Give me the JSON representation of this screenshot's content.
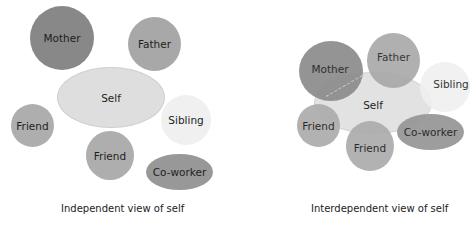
{
  "colors": {
    "mother": "#888888",
    "father": "#a8a8a8",
    "self": "#dedede",
    "sibling": "#f0f0f0",
    "friend": "#aeaeae",
    "coworker": "#989898",
    "background": "#ffffff",
    "text": "#1e1e1e"
  },
  "independent": {
    "caption": "Independent view of self",
    "nodes": {
      "mother": "Mother",
      "father": "Father",
      "self": "Self",
      "friend_left": "Friend",
      "sibling": "Sibling",
      "friend_bottom": "Friend",
      "coworker": "Co-worker"
    }
  },
  "interdependent": {
    "caption": "Interdependent view of self",
    "nodes": {
      "mother": "Mother",
      "father": "Father",
      "self": "Self",
      "sibling": "Sibling",
      "friend_left": "Friend",
      "friend_bottom": "Friend",
      "coworker": "Co-worker"
    }
  }
}
